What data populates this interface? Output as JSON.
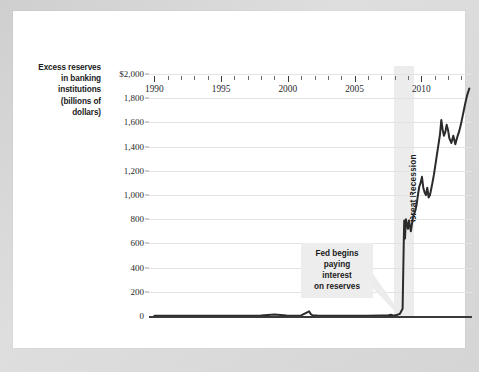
{
  "figure": {
    "background_color": "#d5d5d5",
    "card_color": "#ffffff"
  },
  "axis_title": {
    "line1": "Excess reserves",
    "line2": "in banking",
    "line3": "institutions",
    "line4": "(billions of",
    "line5": "dollars)"
  },
  "annotations": {
    "fed": {
      "line1": "Fed begins",
      "line2": "paying interest",
      "line3": "on reserves",
      "background": "#ededed",
      "points_to_year": 2008.6
    },
    "recession": {
      "label": "Great Recession",
      "band_color": "#ececec",
      "start_year": 2007.95,
      "end_year": 2009.45
    }
  },
  "chart_data": {
    "type": "line",
    "title": "",
    "xlabel": "",
    "ylabel": "Excess reserves in banking institutions (billions of dollars)",
    "xlim": [
      1989.6,
      2013.8
    ],
    "ylim": [
      0,
      2000
    ],
    "ytick_labels": [
      "$2,000",
      "1,800",
      "1,600",
      "1,400",
      "1,200",
      "1,000",
      "800",
      "600",
      "400",
      "200",
      "0"
    ],
    "yticks": [
      2000,
      1800,
      1600,
      1400,
      1200,
      1000,
      800,
      600,
      400,
      200,
      0
    ],
    "xtick_labels": [
      "1990",
      "1995",
      "2000",
      "2005",
      "2010"
    ],
    "xticks": [
      1990,
      1995,
      2000,
      2005,
      2010
    ],
    "xtick_minor_step": 1,
    "grid": "horizontal",
    "legend": "none",
    "line_color": "#2b2b2b",
    "line_width": 2.0,
    "series": [
      {
        "name": "Excess reserves",
        "x": [
          1990.0,
          1991.0,
          1992.0,
          1993.0,
          1994.0,
          1995.0,
          1996.0,
          1997.0,
          1998.0,
          1999.0,
          1999.9,
          2000.3,
          2001.0,
          2001.6,
          2001.72,
          2001.85,
          2002.2,
          2003.0,
          2004.0,
          2005.0,
          2006.0,
          2007.0,
          2007.5,
          2007.72,
          2007.85,
          2008.0,
          2008.2,
          2008.4,
          2008.6,
          2008.68,
          2008.72,
          2008.78,
          2008.85,
          2008.92,
          2009.0,
          2009.08,
          2009.15,
          2009.22,
          2009.3,
          2009.38,
          2009.45,
          2009.55,
          2009.65,
          2009.75,
          2009.85,
          2009.95,
          2010.05,
          2010.15,
          2010.25,
          2010.35,
          2010.45,
          2010.55,
          2010.65,
          2010.8,
          2010.95,
          2011.1,
          2011.25,
          2011.4,
          2011.5,
          2011.6,
          2011.7,
          2011.8,
          2011.9,
          2012.0,
          2012.1,
          2012.25,
          2012.4,
          2012.55,
          2012.7,
          2012.85,
          2013.0,
          2013.15,
          2013.3,
          2013.45,
          2013.6
        ],
        "y": [
          2,
          2,
          2,
          2,
          2,
          2,
          3,
          3,
          4,
          12,
          5,
          3,
          5,
          38,
          16,
          6,
          4,
          3,
          3,
          3,
          3,
          4,
          4,
          10,
          6,
          5,
          10,
          18,
          60,
          560,
          790,
          640,
          800,
          760,
          720,
          790,
          740,
          700,
          760,
          820,
          840,
          870,
          920,
          1000,
          1070,
          1100,
          1150,
          1060,
          1020,
          1000,
          1060,
          980,
          1000,
          1080,
          1170,
          1280,
          1390,
          1500,
          1620,
          1540,
          1490,
          1520,
          1580,
          1540,
          1470,
          1430,
          1490,
          1420,
          1480,
          1530,
          1600,
          1680,
          1760,
          1830,
          1880
        ]
      }
    ]
  }
}
